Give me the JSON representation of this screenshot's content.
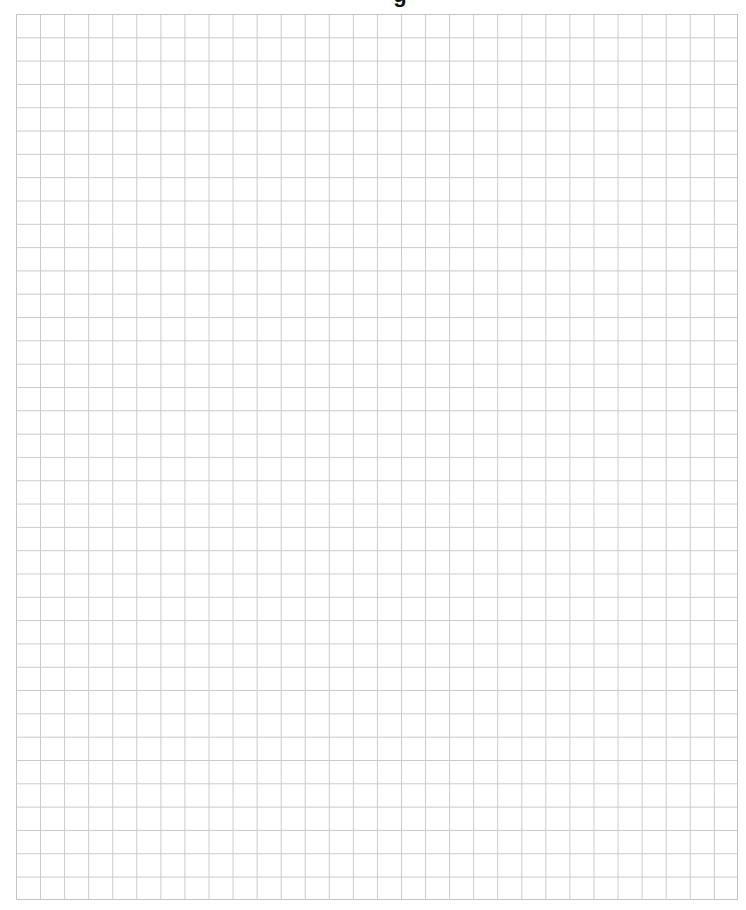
{
  "page": {
    "heading_fragment": "g"
  },
  "grid": {
    "columns": 30,
    "rows": 38,
    "line_color": "#cacaca",
    "border_color": "#c4c4c4",
    "background_color": "#ffffff"
  }
}
